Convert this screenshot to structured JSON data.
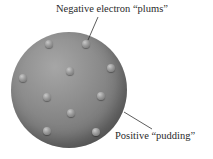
{
  "diagram": {
    "labels": {
      "electrons": "Negative electron “plums”",
      "pudding": "Positive “pudding”"
    },
    "colors": {
      "sphere": "#8a8a8a",
      "plum": "#9a9a9a",
      "text": "#2a2a2a",
      "leader": "#333333"
    },
    "electron_count": 12
  }
}
